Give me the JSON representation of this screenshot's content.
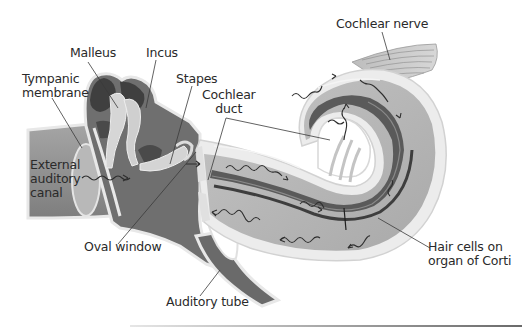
{
  "diagram": {
    "type": "anatomical-illustration",
    "labels": [
      {
        "id": "cochlear-nerve",
        "text": "Cochlear nerve"
      },
      {
        "id": "malleus",
        "text": "Malleus"
      },
      {
        "id": "incus",
        "text": "Incus"
      },
      {
        "id": "tympanic-membrane",
        "text": "Tympanic\nmembrane",
        "lines": [
          "Tympanic",
          "membrane"
        ]
      },
      {
        "id": "stapes",
        "text": "Stapes"
      },
      {
        "id": "cochlear-duct",
        "text": "Cochlear\nduct",
        "lines": [
          "Cochlear",
          "duct"
        ]
      },
      {
        "id": "external-auditory-canal",
        "text": "External\nauditory\ncanal",
        "lines": [
          "External",
          "auditory",
          "canal"
        ]
      },
      {
        "id": "oval-window",
        "text": "Oval window"
      },
      {
        "id": "hair-cells",
        "text": "Hair cells on\norgan of Corti",
        "lines": [
          "Hair cells on",
          "organ of Corti"
        ]
      },
      {
        "id": "auditory-tube",
        "text": "Auditory tube"
      }
    ],
    "colors": {
      "outer_wall": "#ededed",
      "canal_fill": "#8c8c8c",
      "middle_fill": "#6f6f6f",
      "bone_dark": "#4a4a4a",
      "ossicle": "#d4d4d4",
      "cochlea_fill": "#b4b4b4",
      "duct_dark": "#5a5a5a",
      "wave": "#2e2e2e",
      "leader": "#3a3a3a"
    }
  }
}
